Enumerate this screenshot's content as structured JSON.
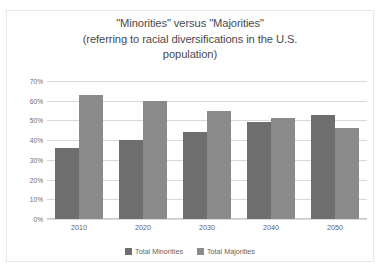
{
  "chart_data": {
    "type": "bar",
    "title": "\"Minorities\" versus \"Majorities\" (referring to racial diversifications in the U.S. population)",
    "title_lines": [
      "\"Minorities\" versus \"Majorities\"",
      "(referring to racial diversifications in the U.S.",
      "population)"
    ],
    "categories": [
      "2010",
      "2020",
      "2030",
      "2040",
      "2050"
    ],
    "series": [
      {
        "name": "Total Minorities",
        "color": "#6e6e6e",
        "values": [
          36,
          40,
          44,
          49,
          53
        ]
      },
      {
        "name": "Total Majorities",
        "color": "#8a8a8a",
        "values": [
          63,
          60,
          55,
          51,
          46
        ]
      }
    ],
    "xlabel": "",
    "ylabel": "",
    "ylim": [
      0,
      70
    ],
    "ytick_values": [
      70,
      60,
      50,
      40,
      30,
      20,
      10,
      0
    ],
    "ytick_labels": [
      "70%",
      "60%",
      "50%",
      "40%",
      "30%",
      "20%",
      "10%",
      "0%"
    ],
    "grid": true,
    "legend_position": "bottom"
  }
}
